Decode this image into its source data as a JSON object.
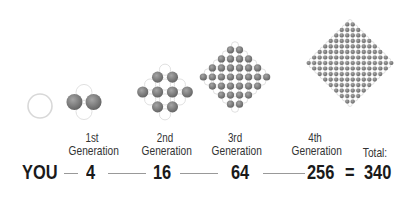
{
  "colors": {
    "filled": "#7a7a7a",
    "empty_stroke": "#d8d8d8",
    "text": "#1a1a1a",
    "label": "#333333",
    "connector": "#999999"
  },
  "you": {
    "label": "YOU"
  },
  "generations": [
    {
      "ordinal": "1st",
      "label": "Generation",
      "count": "4"
    },
    {
      "ordinal": "2nd",
      "label": "Generation",
      "count": "16"
    },
    {
      "ordinal": "3rd",
      "label": "Generation",
      "count": "64"
    },
    {
      "ordinal": "4th",
      "label": "Generation",
      "count": "256"
    }
  ],
  "total": {
    "label": "Total:",
    "equals": "=",
    "value": "340"
  }
}
